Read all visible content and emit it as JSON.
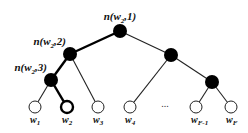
{
  "diagram": {
    "type": "binary-tree",
    "highlighted_path_leaf": "w2",
    "colors": {
      "line": "#222222",
      "node_fill": "#000000",
      "leaf_fill": "#ffffff",
      "background": "#ffffff"
    },
    "internal_nodes": [
      {
        "id": "root",
        "x": 120,
        "y": 31,
        "label": {
          "base": "n(w",
          "sub": "2",
          "tail": ",1)"
        }
      },
      {
        "id": "l2",
        "x": 70,
        "y": 54,
        "label": {
          "base": "n(w",
          "sub": "2",
          "tail": ",2)"
        }
      },
      {
        "id": "l3",
        "x": 51,
        "y": 80,
        "label": {
          "base": "n(w",
          "sub": "2",
          "tail": ",3)"
        }
      },
      {
        "id": "r2",
        "x": 171,
        "y": 55
      },
      {
        "id": "r3",
        "x": 212,
        "y": 82
      }
    ],
    "leaves": [
      {
        "id": "w1",
        "x": 35,
        "y": 107,
        "label": {
          "base": "w",
          "sub": "1"
        }
      },
      {
        "id": "w2",
        "x": 67,
        "y": 107,
        "label": {
          "base": "w",
          "sub": "2"
        },
        "highlighted": true
      },
      {
        "id": "w3",
        "x": 98,
        "y": 107,
        "label": {
          "base": "w",
          "sub": "3"
        }
      },
      {
        "id": "w4",
        "x": 130,
        "y": 107,
        "label": {
          "base": "w",
          "sub": "4"
        }
      },
      {
        "id": "wF-1",
        "x": 196,
        "y": 107,
        "label": {
          "base": "w",
          "sub": "F-1"
        }
      },
      {
        "id": "wF",
        "x": 231,
        "y": 107,
        "label": {
          "base": "w",
          "sub": "F"
        }
      }
    ],
    "ellipsis": {
      "text": "...",
      "x": 165,
      "y": 107
    },
    "edges": [
      {
        "from": "root",
        "to": "l2",
        "highlighted": true
      },
      {
        "from": "root",
        "to": "r2"
      },
      {
        "from": "l2",
        "to": "l3",
        "highlighted": true
      },
      {
        "from": "l2",
        "to": "w3"
      },
      {
        "from": "l3",
        "to": "w1"
      },
      {
        "from": "l3",
        "to": "w2",
        "highlighted": true
      },
      {
        "from": "r2",
        "to": "w4"
      },
      {
        "from": "r2",
        "to": "r3"
      },
      {
        "from": "r3",
        "to": "wF-1"
      },
      {
        "from": "r3",
        "to": "wF"
      }
    ]
  }
}
